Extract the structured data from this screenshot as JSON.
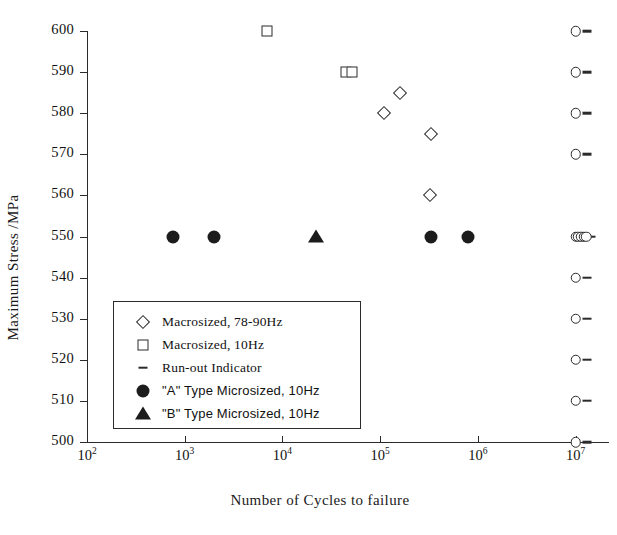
{
  "chart_data": {
    "type": "scatter",
    "title": "",
    "xlabel": "Number of Cycles to failure",
    "ylabel": "Maximum Stress /MPa",
    "x_scale": "log",
    "xlim": [
      100,
      20000000
    ],
    "ylim": [
      500,
      600
    ],
    "grid": false,
    "legend_position": "lower-left-inside",
    "x_ticks": [
      {
        "value": 100,
        "label_base": "10",
        "label_exp": "2"
      },
      {
        "value": 1000,
        "label_base": "10",
        "label_exp": "3"
      },
      {
        "value": 10000,
        "label_base": "10",
        "label_exp": "4"
      },
      {
        "value": 100000,
        "label_base": "10",
        "label_exp": "5"
      },
      {
        "value": 1000000,
        "label_base": "10",
        "label_exp": "6"
      },
      {
        "value": 10000000,
        "label_base": "10",
        "label_exp": "7"
      }
    ],
    "y_ticks": [
      600,
      590,
      580,
      570,
      560,
      550,
      540,
      530,
      520,
      510,
      500
    ],
    "series": [
      {
        "name": "Macrosized, 78-90Hz",
        "marker": "open-diamond",
        "color": "#2b2b2b",
        "points": [
          {
            "x": 160000,
            "y": 585
          },
          {
            "x": 110000,
            "y": 580
          },
          {
            "x": 330000,
            "y": 575
          },
          {
            "x": 320000,
            "y": 560
          }
        ]
      },
      {
        "name": "Macrosized, 10Hz",
        "marker": "open-square",
        "color": "#2b2b2b",
        "points": [
          {
            "x": 7000,
            "y": 600
          },
          {
            "x": 45000,
            "y": 590
          },
          {
            "x": 52000,
            "y": 590
          }
        ]
      },
      {
        "name": "Run-out Indicator",
        "marker": "dash",
        "color": "#2b2b2b",
        "points": [
          {
            "x": 13000000,
            "y": 600
          },
          {
            "x": 13000000,
            "y": 590
          },
          {
            "x": 13000000,
            "y": 580
          },
          {
            "x": 13000000,
            "y": 570
          },
          {
            "x": 14500000,
            "y": 550
          },
          {
            "x": 13000000,
            "y": 540
          },
          {
            "x": 13000000,
            "y": 530
          },
          {
            "x": 13000000,
            "y": 520
          },
          {
            "x": 13000000,
            "y": 510
          },
          {
            "x": 13000000,
            "y": 500
          }
        ]
      },
      {
        "name": "Run-out open circles at 10^7",
        "marker": "open-circle",
        "color": "#2b2b2b",
        "points": [
          {
            "x": 10000000,
            "y": 600
          },
          {
            "x": 10000000,
            "y": 590
          },
          {
            "x": 10000000,
            "y": 580
          },
          {
            "x": 10000000,
            "y": 570
          },
          {
            "x": 10000000,
            "y": 550
          },
          {
            "x": 10700000,
            "y": 550
          },
          {
            "x": 11400000,
            "y": 550
          },
          {
            "x": 12100000,
            "y": 550
          },
          {
            "x": 12800000,
            "y": 550
          },
          {
            "x": 10000000,
            "y": 540
          },
          {
            "x": 10000000,
            "y": 530
          },
          {
            "x": 10000000,
            "y": 520
          },
          {
            "x": 10000000,
            "y": 510
          },
          {
            "x": 10000000,
            "y": 500
          }
        ]
      },
      {
        "name": "\"A\" Type Microsized, 10Hz",
        "marker": "filled-circle",
        "color": "#1c1c1c",
        "points": [
          {
            "x": 750,
            "y": 550
          },
          {
            "x": 2000,
            "y": 550
          },
          {
            "x": 330000,
            "y": 550
          },
          {
            "x": 800000,
            "y": 550
          }
        ]
      },
      {
        "name": "\"B\" Type Microsized, 10Hz",
        "marker": "filled-triangle",
        "color": "#1c1c1c",
        "points": [
          {
            "x": 22000,
            "y": 550
          }
        ]
      }
    ],
    "legend": [
      {
        "symbol": "open-diamond",
        "label": "Macrosized, 78-90Hz",
        "font": "serif"
      },
      {
        "symbol": "open-square",
        "label": "Macrosized, 10Hz",
        "font": "serif"
      },
      {
        "symbol": "dash",
        "label": "Run-out Indicator",
        "font": "serif"
      },
      {
        "symbol": "filled-circle",
        "label": "\"A\" Type Microsized, 10Hz",
        "font": "sans"
      },
      {
        "symbol": "filled-triangle",
        "label": "\"B\" Type Microsized, 10Hz",
        "font": "sans"
      }
    ]
  }
}
